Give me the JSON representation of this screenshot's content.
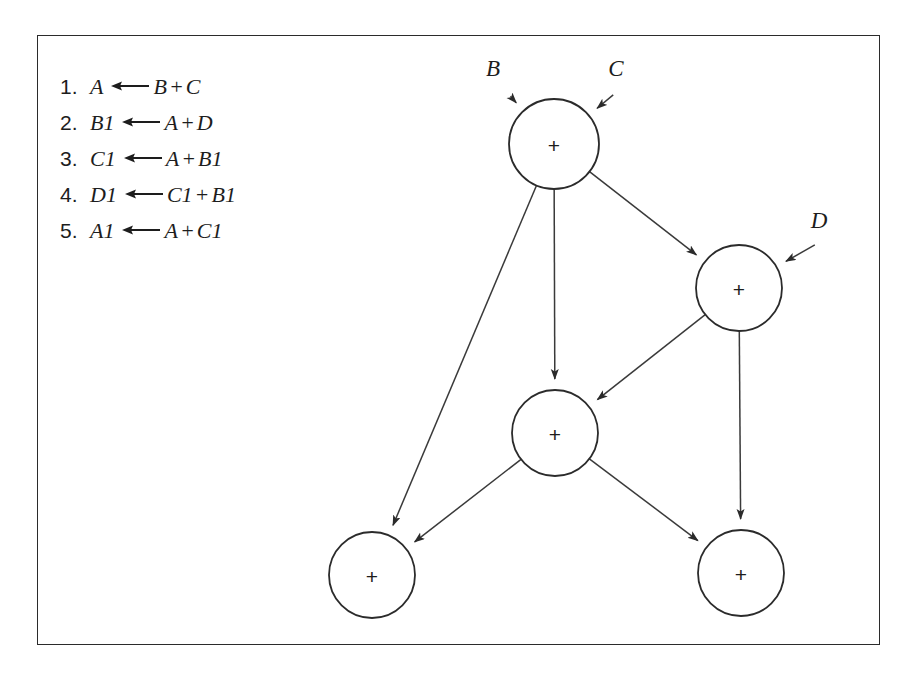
{
  "figure": {
    "caption_absent": true,
    "border_color": "#2b2b2b",
    "background": "#ffffff"
  },
  "instructions": {
    "title_absent": true,
    "items": [
      {
        "index": "1.",
        "dest": "A",
        "arrow": "left-arrow",
        "expr_left": "B",
        "op": "+",
        "expr_right": "C"
      },
      {
        "index": "2.",
        "dest": "B1",
        "arrow": "left-arrow",
        "expr_left": "A",
        "op": "+",
        "expr_right": "D"
      },
      {
        "index": "3.",
        "dest": "C1",
        "arrow": "left-arrow",
        "expr_left": "A",
        "op": "+",
        "expr_right": "B1"
      },
      {
        "index": "4.",
        "dest": "D1",
        "arrow": "left-arrow",
        "expr_left": "C1",
        "op": "+",
        "expr_right": "B1"
      },
      {
        "index": "5.",
        "dest": "A1",
        "arrow": "left-arrow",
        "expr_left": "A",
        "op": "+",
        "expr_right": "C1"
      }
    ]
  },
  "graph": {
    "type": "dataflow-dag",
    "node_symbol": "+",
    "nodes": [
      {
        "id": "n1",
        "label": "+",
        "cx": 516,
        "cy": 108,
        "r": 45,
        "name": "adder-node-a"
      },
      {
        "id": "n2",
        "label": "+",
        "cx": 701,
        "cy": 252,
        "r": 43,
        "name": "adder-node-b1"
      },
      {
        "id": "n3",
        "label": "+",
        "cx": 517,
        "cy": 397,
        "r": 43,
        "name": "adder-node-c1"
      },
      {
        "id": "n4",
        "label": "+",
        "cx": 334,
        "cy": 539,
        "r": 43,
        "name": "adder-node-a1"
      },
      {
        "id": "n5",
        "label": "+",
        "cx": 703,
        "cy": 537,
        "r": 43,
        "name": "adder-node-d1"
      }
    ],
    "inputs": [
      {
        "label": "B",
        "x": 455,
        "y": 40,
        "target": "n1",
        "name": "input-port-b"
      },
      {
        "label": "C",
        "x": 578,
        "y": 40,
        "target": "n1",
        "name": "input-port-c"
      },
      {
        "label": "D",
        "x": 781,
        "y": 192,
        "target": "n2",
        "name": "input-port-d"
      }
    ],
    "edges": [
      {
        "from": "n1",
        "to": "n2",
        "name": "edge-a-to-b1"
      },
      {
        "from": "n1",
        "to": "n3",
        "name": "edge-a-to-c1"
      },
      {
        "from": "n1",
        "to": "n4",
        "name": "edge-a-to-a1"
      },
      {
        "from": "n2",
        "to": "n3",
        "name": "edge-b1-to-c1"
      },
      {
        "from": "n2",
        "to": "n5",
        "name": "edge-b1-to-d1"
      },
      {
        "from": "n3",
        "to": "n4",
        "name": "edge-c1-to-a1"
      },
      {
        "from": "n3",
        "to": "n5",
        "name": "edge-c1-to-d1"
      }
    ]
  }
}
